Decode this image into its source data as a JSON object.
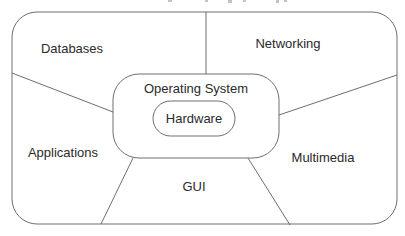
{
  "diagram": {
    "type": "layered-system-diagram",
    "stroke_color": "#6e6e6e",
    "text_color": "#2a2a2a",
    "background": "#ffffff",
    "core": {
      "outer_label": "Operating System",
      "inner_label": "Hardware"
    },
    "regions": [
      {
        "id": "databases",
        "label": "Databases"
      },
      {
        "id": "networking",
        "label": "Networking"
      },
      {
        "id": "applications",
        "label": "Applications"
      },
      {
        "id": "multimedia",
        "label": "Multimedia"
      },
      {
        "id": "gui",
        "label": "GUI"
      }
    ]
  }
}
